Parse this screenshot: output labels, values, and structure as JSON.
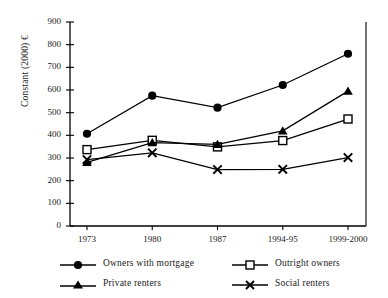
{
  "partial_cutoff_text": "",
  "chart_data": {
    "type": "line",
    "title": "",
    "xlabel": "",
    "ylabel": "Constant (2000) €",
    "categories": [
      "1973",
      "1980",
      "1987",
      "1994-95",
      "1999-2000"
    ],
    "ylim": [
      0,
      900
    ],
    "yticks": [
      "0",
      "100",
      "200",
      "300",
      "400",
      "500",
      "600",
      "700",
      "800",
      "900"
    ],
    "grid": false,
    "legend_position": "bottom",
    "series": [
      {
        "name": "Owners with mortgage",
        "marker": "filled-circle",
        "color": "#000000",
        "values": [
          407,
          575,
          522,
          622,
          760
        ]
      },
      {
        "name": "Outright owners",
        "marker": "open-square",
        "color": "#000000",
        "values": [
          337,
          378,
          349,
          377,
          472
        ]
      },
      {
        "name": "Private renters",
        "marker": "filled-triangle",
        "color": "#000000",
        "values": [
          281,
          368,
          360,
          420,
          595
        ]
      },
      {
        "name": "Social renters",
        "marker": "x-cross",
        "color": "#000000",
        "values": [
          293,
          323,
          249,
          250,
          302
        ]
      }
    ]
  }
}
